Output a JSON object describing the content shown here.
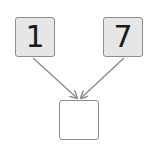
{
  "diagram": {
    "type": "number-bond",
    "left_box": {
      "value": "1",
      "position": [
        15,
        17,
        40,
        40
      ]
    },
    "right_box": {
      "value": "7",
      "position": [
        103,
        17,
        40,
        40
      ]
    },
    "result_box": {
      "value": "",
      "position": [
        59,
        100,
        40,
        40
      ]
    },
    "arrows": [
      {
        "from": "left_box",
        "to": "result_box"
      },
      {
        "from": "right_box",
        "to": "result_box"
      }
    ],
    "colors": {
      "box_fill": "#e6e6e6",
      "border": "#8c8c8c",
      "arrow": "#8c8c8c",
      "text": "#1a1a1a"
    }
  }
}
